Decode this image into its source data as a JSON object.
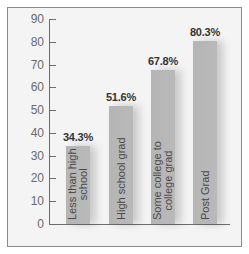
{
  "chart_data": {
    "type": "bar",
    "title": "",
    "xlabel": "",
    "ylabel": "",
    "categories": [
      "Less than high school",
      "High school grad",
      "Some college to college grad",
      "Post Grad"
    ],
    "category_lines": [
      [
        "Less than high",
        "school"
      ],
      [
        "High school grad"
      ],
      [
        "Some college to",
        "college grad"
      ],
      [
        "Post Grad"
      ]
    ],
    "values": [
      34.3,
      51.6,
      67.8,
      80.3
    ],
    "value_labels": [
      "34.3%",
      "51.6%",
      "67.8%",
      "80.3%"
    ],
    "ylim": [
      0,
      90
    ],
    "yticks": [
      0,
      10,
      20,
      30,
      40,
      50,
      60,
      70,
      80,
      90
    ],
    "ytick_labels": [
      "0",
      "10",
      "20",
      "30",
      "40",
      "50",
      "60",
      "70",
      "80",
      "90"
    ],
    "grid": false,
    "legend": null,
    "bar_color": "#b7b7b7"
  }
}
